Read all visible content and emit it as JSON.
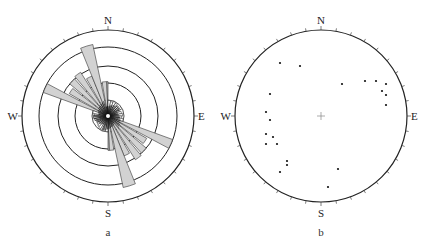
{
  "panels": [
    {
      "id": "a",
      "type": "rose_diagram",
      "caption": "a",
      "center": [
        108,
        116
      ],
      "outer_radius": 86,
      "ring_radii": [
        33,
        50,
        69
      ],
      "inner_circle_radius": 16,
      "tick_interval_deg": 10,
      "labels": {
        "N": "N",
        "E": "E",
        "S": "S",
        "W": "W"
      },
      "petal_fill": "#d2d2d2",
      "petal_stroke": "#333333",
      "petals": [
        {
          "from": 290,
          "to": 298,
          "r": 0.8
        },
        {
          "from": 300,
          "to": 308,
          "r": 0.52
        },
        {
          "from": 310,
          "to": 318,
          "r": 0.58
        },
        {
          "from": 320,
          "to": 328,
          "r": 0.6
        },
        {
          "from": 330,
          "to": 338,
          "r": 0.5
        },
        {
          "from": 338,
          "to": 348,
          "r": 0.85
        },
        {
          "from": 350,
          "to": 358,
          "r": 0.4
        },
        {
          "from": 358,
          "to": 360,
          "r": 0.4
        },
        {
          "from": 0,
          "to": 10,
          "r": 0.18
        },
        {
          "from": 10,
          "to": 20,
          "r": 0.17
        },
        {
          "from": 20,
          "to": 30,
          "r": 0.18
        },
        {
          "from": 30,
          "to": 40,
          "r": 0.17
        },
        {
          "from": 40,
          "to": 50,
          "r": 0.16
        },
        {
          "from": 50,
          "to": 60,
          "r": 0.15
        },
        {
          "from": 60,
          "to": 70,
          "r": 0.14
        },
        {
          "from": 70,
          "to": 80,
          "r": 0.16
        },
        {
          "from": 80,
          "to": 90,
          "r": 0.17
        },
        {
          "from": 270,
          "to": 280,
          "r": 0.16
        },
        {
          "from": 280,
          "to": 290,
          "r": 0.18
        }
      ]
    },
    {
      "id": "b",
      "type": "stereonet",
      "caption": "b",
      "center": [
        321,
        116
      ],
      "outer_radius": 86,
      "tick_interval_deg": 10,
      "labels": {
        "N": "N",
        "E": "E",
        "S": "S",
        "W": "W"
      },
      "center_mark": "+",
      "points": [
        [
          280,
          63
        ],
        [
          300,
          66
        ],
        [
          342,
          84
        ],
        [
          365,
          81
        ],
        [
          376,
          81
        ],
        [
          386,
          84
        ],
        [
          382,
          91
        ],
        [
          386,
          95
        ],
        [
          386,
          105
        ],
        [
          270,
          94
        ],
        [
          266,
          112
        ],
        [
          270,
          120
        ],
        [
          266,
          134
        ],
        [
          273,
          137
        ],
        [
          266,
          144
        ],
        [
          277,
          144
        ],
        [
          287,
          161
        ],
        [
          287,
          165
        ],
        [
          280,
          172
        ],
        [
          338,
          169
        ],
        [
          328,
          187
        ]
      ]
    }
  ]
}
